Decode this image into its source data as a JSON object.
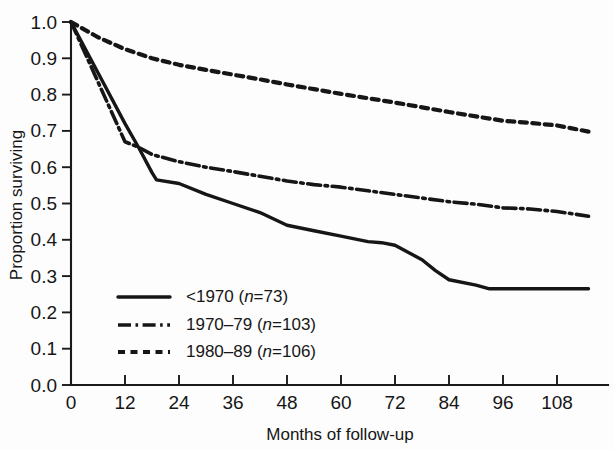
{
  "chart_data": {
    "type": "line",
    "title": "",
    "xlabel": "Months of follow-up",
    "ylabel": "Proportion surviving",
    "xlim": [
      0,
      118
    ],
    "ylim": [
      0.0,
      1.0
    ],
    "grid": false,
    "legend_position": "inside lower-left",
    "xticks": [
      0,
      12,
      24,
      36,
      48,
      60,
      72,
      84,
      96,
      108
    ],
    "xtick_labels": [
      "0",
      "12",
      "24",
      "36",
      "48",
      "60",
      "72",
      "84",
      "96",
      "108"
    ],
    "yticks": [
      0.0,
      0.1,
      0.2,
      0.3,
      0.4,
      0.5,
      0.6,
      0.7,
      0.8,
      0.9,
      1.0
    ],
    "ytick_labels": [
      "0.0",
      "0.1",
      "0.2",
      "0.3",
      "0.4",
      "0.5",
      "0.6",
      "0.7",
      "0.8",
      "0.9",
      "1.0"
    ],
    "series": [
      {
        "name": "<1970 (n=73)",
        "label_plain": "<1970",
        "n": 73,
        "style": "solid",
        "color": "#161616",
        "x": [
          0,
          6,
          12,
          15,
          18,
          19,
          24,
          30,
          36,
          42,
          48,
          54,
          60,
          66,
          69,
          72,
          78,
          81,
          84,
          90,
          93,
          96,
          102,
          108,
          115
        ],
        "y": [
          1.0,
          0.86,
          0.72,
          0.655,
          0.585,
          0.565,
          0.555,
          0.525,
          0.5,
          0.475,
          0.44,
          0.425,
          0.41,
          0.395,
          0.392,
          0.385,
          0.345,
          0.315,
          0.29,
          0.275,
          0.265,
          0.265,
          0.265,
          0.265,
          0.265
        ]
      },
      {
        "name": "1970–79 (n=103)",
        "label_plain": "1970–79",
        "n": 103,
        "style": "dashdot",
        "color": "#161616",
        "x": [
          0,
          6,
          12,
          15,
          18,
          24,
          30,
          36,
          42,
          48,
          54,
          60,
          66,
          72,
          78,
          84,
          90,
          96,
          102,
          108,
          115
        ],
        "y": [
          1.0,
          0.835,
          0.67,
          0.655,
          0.635,
          0.615,
          0.6,
          0.588,
          0.575,
          0.562,
          0.552,
          0.545,
          0.535,
          0.525,
          0.515,
          0.505,
          0.498,
          0.488,
          0.485,
          0.478,
          0.465
        ]
      },
      {
        "name": "1980–89 (n=106)",
        "label_plain": "1980–89",
        "n": 106,
        "style": "dotted",
        "color": "#161616",
        "x": [
          0,
          6,
          12,
          18,
          24,
          30,
          36,
          42,
          48,
          54,
          60,
          66,
          72,
          78,
          84,
          90,
          96,
          102,
          108,
          115
        ],
        "y": [
          1.0,
          0.958,
          0.925,
          0.9,
          0.882,
          0.868,
          0.855,
          0.842,
          0.828,
          0.815,
          0.802,
          0.79,
          0.778,
          0.765,
          0.752,
          0.74,
          0.728,
          0.722,
          0.715,
          0.698
        ]
      }
    ]
  },
  "legend": {
    "entries": [
      {
        "prefix": "<1970 (",
        "ital": "n",
        "suffix": "=73)",
        "style": "solid"
      },
      {
        "prefix": "1970–79 (",
        "ital": "n",
        "suffix": "=103)",
        "style": "dashdot"
      },
      {
        "prefix": "1980–89 (",
        "ital": "n",
        "suffix": "=106)",
        "style": "dotted"
      }
    ]
  }
}
